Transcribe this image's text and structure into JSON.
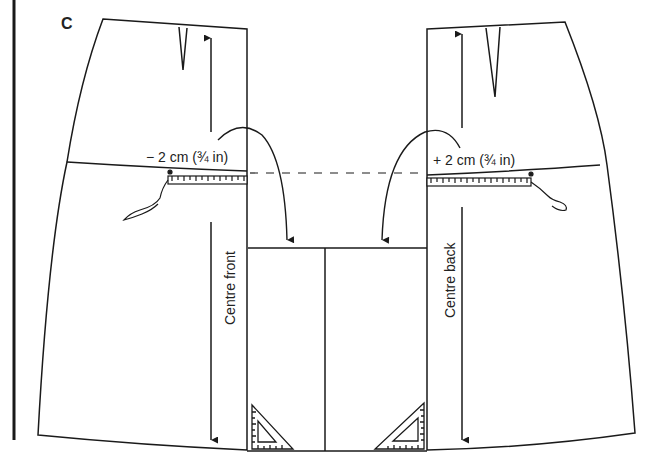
{
  "figure": {
    "panel_letter": "C",
    "front": {
      "adjustment_label": "− 2 cm (¾ in)",
      "grain_label": "Centre front"
    },
    "back": {
      "adjustment_label": "+ 2 cm (¾ in)",
      "grain_label": "Centre back"
    },
    "colors": {
      "ink": "#1a1a1a",
      "paper": "#ffffff"
    },
    "icons": [
      "tape-measure-icon",
      "set-square-icon",
      "curved-arrow-icon",
      "grain-arrow-icon",
      "dart-icon"
    ]
  }
}
